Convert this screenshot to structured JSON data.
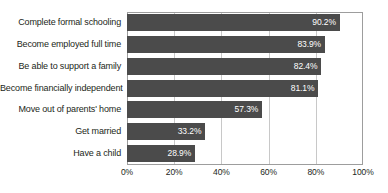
{
  "chart_data": {
    "type": "bar",
    "orientation": "horizontal",
    "title": "",
    "xlabel": "",
    "ylabel": "",
    "xlim": [
      0,
      100
    ],
    "grid": true,
    "legend": null,
    "categories": [
      "Complete formal schooling",
      "Become employed full time",
      "Be able to support a family",
      "Become financially independent",
      "Move out of parents' home",
      "Get married",
      "Have a child"
    ],
    "values": [
      90.2,
      83.9,
      82.4,
      81.1,
      57.3,
      33.2,
      28.9
    ],
    "value_labels": [
      "90.2%",
      "83.9%",
      "82.4%",
      "81.1%",
      "57.3%",
      "33.2%",
      "28.9%"
    ],
    "xticks": [
      0,
      20,
      40,
      60,
      80,
      100
    ],
    "xtick_labels": [
      "0%",
      "20%",
      "40%",
      "60%",
      "80%",
      "100%"
    ]
  },
  "style": {
    "bar_color": "#4b4b4b",
    "grid_color": "#c8c8c8",
    "frame_color": "#9d9d9d",
    "value_label_color": "#ffffff",
    "text_color": "#231f20",
    "background": "#ffffff"
  },
  "artifacts": {
    "top_residue_text": ""
  }
}
